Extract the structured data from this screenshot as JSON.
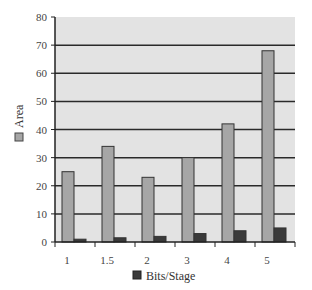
{
  "chart_data": {
    "type": "bar",
    "title": "",
    "xlabel": "",
    "ylabel": "",
    "categories": [
      "1",
      "1.5",
      "2",
      "3",
      "4",
      "5"
    ],
    "series": [
      {
        "name": "Area",
        "color": "#a6a6a6",
        "values": [
          25,
          34,
          23,
          30,
          42,
          68
        ]
      },
      {
        "name": "Bits/Stage",
        "color": "#3a3a3a",
        "values": [
          1,
          1.5,
          2,
          3,
          4,
          5
        ]
      }
    ],
    "ylim": [
      0,
      80
    ],
    "yticks": [
      0,
      10,
      20,
      30,
      40,
      50,
      60,
      70,
      80
    ],
    "grid": true,
    "plot_background": "#e3e3e3",
    "legend": [
      {
        "label": "Area",
        "position": "left-vertical"
      },
      {
        "label": "Bits/Stage",
        "position": "bottom"
      }
    ]
  }
}
